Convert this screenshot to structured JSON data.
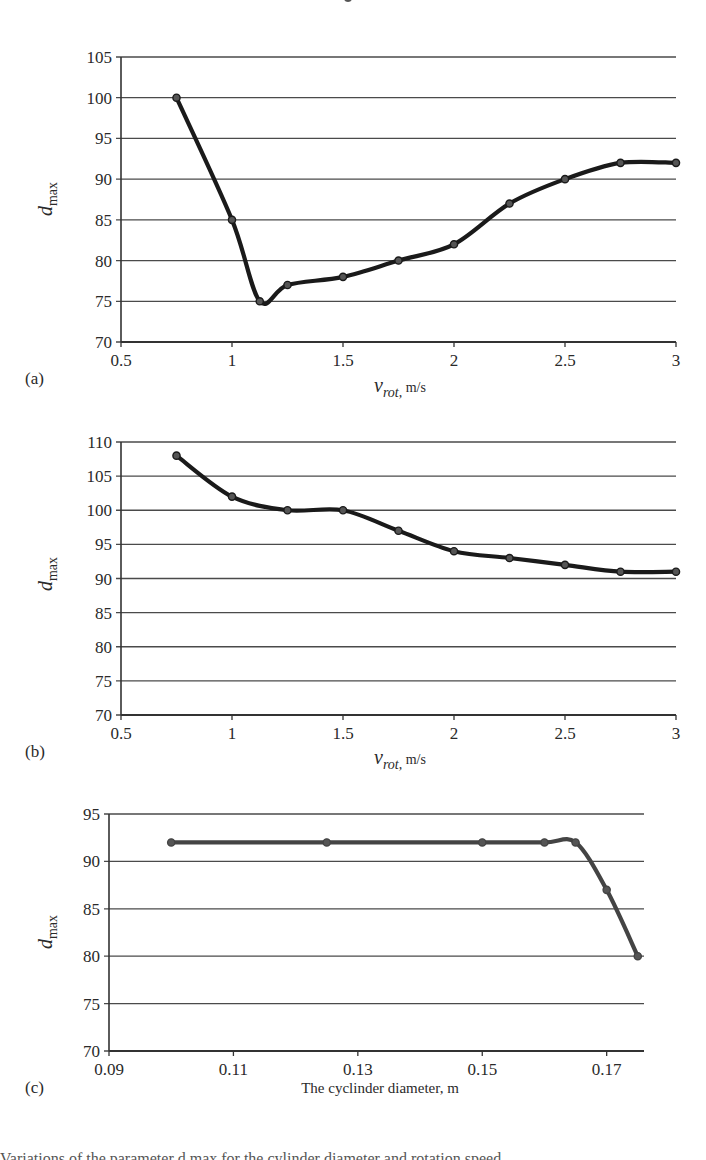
{
  "chart_data": [
    {
      "panel": "(a)",
      "type": "line",
      "title": "",
      "xlabel_main": "v",
      "xlabel_sub": "rot,",
      "xlabel_unit": " m/s",
      "ylabel_main": "d",
      "ylabel_sub": "max",
      "xlim": [
        0.5,
        3
      ],
      "ylim": [
        70,
        105
      ],
      "xticks": [
        0.5,
        1,
        1.5,
        2,
        2.5,
        3
      ],
      "xtick_labels": [
        "0.5",
        "1",
        "1.5",
        "2",
        "2.5",
        "3"
      ],
      "yticks": [
        70,
        75,
        80,
        85,
        90,
        95,
        100,
        105
      ],
      "grid": "horizontal",
      "line_color": "#1a1a1a",
      "series": [
        {
          "name": "d_max",
          "x": [
            0.75,
            1.0,
            1.125,
            1.25,
            1.5,
            1.75,
            2.0,
            2.25,
            2.5,
            2.75,
            3.0
          ],
          "values": [
            100,
            85,
            75,
            77,
            78,
            80,
            82,
            87,
            90,
            92,
            92
          ]
        }
      ]
    },
    {
      "panel": "(b)",
      "type": "line",
      "title": "",
      "xlabel_main": "v",
      "xlabel_sub": "rot,",
      "xlabel_unit": " m/s",
      "ylabel_main": "d",
      "ylabel_sub": "max",
      "xlim": [
        0.5,
        3
      ],
      "ylim": [
        70,
        110
      ],
      "xticks": [
        0.5,
        1,
        1.5,
        2,
        2.5,
        3
      ],
      "xtick_labels": [
        "0.5",
        "1",
        "1.5",
        "2",
        "2.5",
        "3"
      ],
      "yticks": [
        70,
        75,
        80,
        85,
        90,
        95,
        100,
        105,
        110
      ],
      "grid": "horizontal",
      "line_color": "#1a1a1a",
      "series": [
        {
          "name": "d_max",
          "x": [
            0.75,
            1.0,
            1.25,
            1.5,
            1.75,
            2.0,
            2.25,
            2.5,
            2.75,
            3.0
          ],
          "values": [
            108,
            102,
            100,
            100,
            97,
            94,
            93,
            92,
            91,
            91
          ]
        }
      ]
    },
    {
      "panel": "(c)",
      "type": "line",
      "title": "",
      "xlabel_main": "The cyclinder diameter, m",
      "ylabel_main": "d",
      "ylabel_sub": "max",
      "xlim": [
        0.09,
        0.176
      ],
      "ylim": [
        70,
        95
      ],
      "xticks": [
        0.09,
        0.11,
        0.13,
        0.15,
        0.17
      ],
      "xtick_labels": [
        "0.09",
        "0.11",
        "0.13",
        "0.15",
        "0.17"
      ],
      "yticks": [
        70,
        75,
        80,
        85,
        90,
        95
      ],
      "grid": "horizontal",
      "line_color": "#444444",
      "series": [
        {
          "name": "d_max",
          "x": [
            0.1,
            0.125,
            0.15,
            0.16,
            0.165,
            0.17,
            0.175
          ],
          "values": [
            92,
            92,
            92,
            92,
            92,
            87,
            80
          ]
        }
      ]
    }
  ],
  "layout": {
    "panels": [
      {
        "left": 121,
        "right": 676,
        "top": 57,
        "bottom": 342,
        "label_x": 25,
        "label_y": 384,
        "xtitle_x": 400,
        "xtitle_y": 392,
        "ytitle_x": 52,
        "ytitle_y": 199
      },
      {
        "left": 121,
        "right": 676,
        "top": 442,
        "bottom": 715,
        "label_x": 25,
        "label_y": 757,
        "xtitle_x": 400,
        "xtitle_y": 764,
        "ytitle_x": 52,
        "ytitle_y": 574
      },
      {
        "left": 109,
        "right": 644,
        "top": 814,
        "bottom": 1051,
        "label_x": 25,
        "label_y": 1093,
        "xtitle_x": 380,
        "xtitle_y": 1093,
        "ytitle_x": 52,
        "ytitle_y": 932
      }
    ]
  },
  "caption_fragment": "Variations of the parameter d max for the cylinder diameter and rotation speed"
}
